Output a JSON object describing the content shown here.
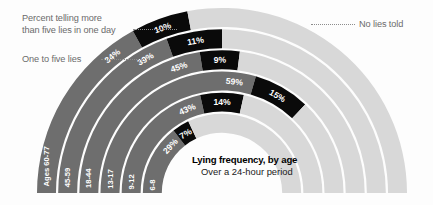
{
  "annotations": {
    "more_than_five": "Percent telling more\nthan five lies in one day",
    "more_than_five_line1": "Percent telling more",
    "more_than_five_line2": "than five lies in one day",
    "one_to_five": "One to five lies",
    "no_lies": "No lies told"
  },
  "caption": {
    "title": "Lying frequency, by age",
    "subtitle": "Over a 24-hour period"
  },
  "colors": {
    "one_to_five": "#6e6e6e",
    "more_than_five": "#0a0a0a",
    "no_lies": "#d8d8d8",
    "background": "#fdfdfd",
    "separator": "#ffffff",
    "annotation_text": "#6b6b6b",
    "caption_text": "#000000"
  },
  "chart_data": {
    "type": "bar",
    "title": "Lying frequency, by age",
    "subtitle": "Over a 24-hour period",
    "orientation": "radial-stacked",
    "categories": [
      "Ages 60-77",
      "45-59",
      "18-44",
      "13-17",
      "9-12",
      "6-8"
    ],
    "series": [
      {
        "name": "One to five lies",
        "color": "#6e6e6e",
        "values": [
          34,
          39,
          45,
          59,
          43,
          29
        ],
        "unit": "%"
      },
      {
        "name": "Percent telling more than five lies in one day",
        "color": "#0a0a0a",
        "values": [
          10,
          11,
          9,
          15,
          14,
          7
        ],
        "unit": "%"
      },
      {
        "name": "No lies told",
        "color": "#d8d8d8",
        "values": [
          56,
          50,
          46,
          26,
          43,
          64
        ],
        "unit": "%"
      }
    ],
    "legend_position": "left-and-right-callouts",
    "grid": false,
    "ylim": [
      0,
      100
    ],
    "xlabel": "",
    "ylabel": ""
  },
  "rings": [
    {
      "age": "Ages 60-77",
      "one_to_five": "34%",
      "more_than_five": "10%"
    },
    {
      "age": "45-59",
      "one_to_five": "39%",
      "more_than_five": "11%"
    },
    {
      "age": "18-44",
      "one_to_five": "45%",
      "more_than_five": "9%"
    },
    {
      "age": "13-17",
      "one_to_five": "59%",
      "more_than_five": "15%"
    },
    {
      "age": "9-12",
      "one_to_five": "43%",
      "more_than_five": "14%"
    },
    {
      "age": "6-8",
      "one_to_five": "29%",
      "more_than_five": "7%"
    }
  ]
}
